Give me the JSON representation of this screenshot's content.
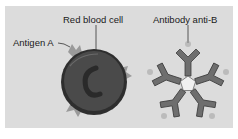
{
  "diagram": {
    "labels": {
      "red_blood_cell": "Red blood cell",
      "antigen": "Antigen A",
      "antibody": "Antibody anti-B"
    },
    "colors": {
      "panel_background": "#dcdcdc",
      "cell_fill": "#3a3a3a",
      "antigen_fill": "#9a9a9a",
      "antibody_fill": "#6e6e6e",
      "antibody_stroke": "#3c3c3c"
    }
  }
}
